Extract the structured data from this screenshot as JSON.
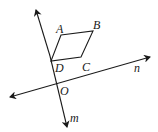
{
  "diagram": {
    "points": {
      "A": {
        "label": "A",
        "x": 61,
        "y": 35
      },
      "B": {
        "label": "B",
        "x": 93,
        "y": 31
      },
      "C": {
        "label": "C",
        "x": 81,
        "y": 57
      },
      "D": {
        "label": "D",
        "x": 51,
        "y": 61
      },
      "O": {
        "label": "O",
        "x": 56,
        "y": 84
      }
    },
    "lines": {
      "m": {
        "label": "m"
      },
      "n": {
        "label": "n"
      }
    },
    "colors": {
      "stroke": "#1a1a1a",
      "background": "#ffffff"
    }
  }
}
